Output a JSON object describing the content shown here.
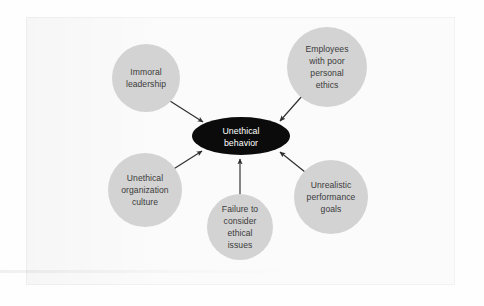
{
  "figure": {
    "type": "hub-and-spoke concept diagram",
    "hub": {
      "label_line1": "Unethical",
      "label_line2": "behavior",
      "shape": "ellipse",
      "fill_color": "#0b0b0b",
      "text_color": "#ffffff"
    },
    "node_fill_color": "#d3d3d3",
    "node_text_color": "#3b3b3b",
    "connector_color": "#2e2e2e",
    "background_color": "#fbfbfb",
    "nodes": [
      {
        "id": "immoral-leadership",
        "lines": [
          "Immoral",
          "leadership"
        ],
        "position": "top-left"
      },
      {
        "id": "employees-poor-personal-ethics",
        "lines": [
          "Employees",
          "with poor",
          "personal",
          "ethics"
        ],
        "position": "top-right"
      },
      {
        "id": "unrealistic-performance-goals",
        "lines": [
          "Unrealistic",
          "performance",
          "goals"
        ],
        "position": "right"
      },
      {
        "id": "failure-to-consider-ethical-issues",
        "lines": [
          "Failure to",
          "consider",
          "ethical",
          "issues"
        ],
        "position": "bottom"
      },
      {
        "id": "unethical-organization-culture",
        "lines": [
          "Unethical",
          "organization",
          "culture"
        ],
        "position": "left"
      }
    ]
  }
}
